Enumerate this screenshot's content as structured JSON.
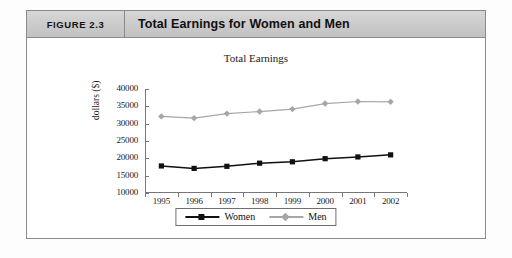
{
  "figure": {
    "tag": "FIGURE 2.3",
    "caption": "Total Earnings for Women and Men"
  },
  "colors": {
    "women": "#111111",
    "men": "#a6a6a6",
    "axis": "#777777",
    "header_bg": "#cdcdcd",
    "frame": "#8a8a8a"
  },
  "chart_data": {
    "type": "line",
    "title": "Total Earnings",
    "xlabel": "",
    "ylabel": "dollars ($)",
    "categories": [
      "1995",
      "1996",
      "1997",
      "1998",
      "1999",
      "2000",
      "2001",
      "2002"
    ],
    "x": [
      1995,
      1996,
      1997,
      1998,
      1999,
      2000,
      2001,
      2002
    ],
    "ylim": [
      10000,
      40000
    ],
    "yticks": [
      10000,
      15000,
      20000,
      25000,
      30000,
      35000,
      40000
    ],
    "ytick_labels": [
      "10000",
      "15000",
      "20000",
      "25000",
      "30000",
      "35000",
      "40000"
    ],
    "grid": false,
    "legend_position": "bottom-center",
    "series": [
      {
        "name": "Women",
        "color": "#111111",
        "marker": "square",
        "values": [
          17800,
          17100,
          17700,
          18600,
          19000,
          19900,
          20400,
          21000
        ]
      },
      {
        "name": "Men",
        "color": "#a6a6a6",
        "marker": "diamond",
        "values": [
          32100,
          31600,
          32900,
          33500,
          34200,
          35800,
          36400,
          36300
        ]
      }
    ]
  }
}
